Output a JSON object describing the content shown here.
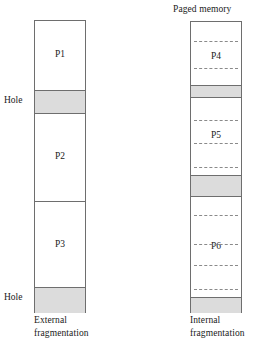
{
  "diagram": {
    "type": "diagram",
    "kind": "memory-fragmentation-comparison",
    "background_color": "#ffffff",
    "line_color": "#6e6e6e",
    "hole_fill_color": "#dcdcdc",
    "free_fill_color": "#ffffff",
    "dash_color": "#8a8a8a"
  },
  "left_column": {
    "name": "contiguous-memory",
    "caption_line1": "External",
    "caption_line2": "fragmentation",
    "title": "",
    "side_labels": [
      {
        "text": "Hole",
        "at_y": 101
      },
      {
        "text": "Hole",
        "at_y": 299
      }
    ],
    "segments": [
      {
        "id": "p1",
        "label": "P1",
        "kind": "process",
        "top": 0,
        "height": 69
      },
      {
        "id": "hole-top",
        "label": "",
        "kind": "hole",
        "top": 69,
        "height": 24
      },
      {
        "id": "p2",
        "label": "P2",
        "kind": "process",
        "top": 93,
        "height": 87
      },
      {
        "id": "p3",
        "label": "P3",
        "kind": "process",
        "top": 180,
        "height": 86
      },
      {
        "id": "hole-bot",
        "label": "",
        "kind": "hole",
        "top": 266,
        "height": 26
      }
    ]
  },
  "right_column": {
    "name": "paged-memory",
    "title": "Paged memory",
    "caption_line1": "Internal",
    "caption_line2": "fragmentation",
    "segments": [
      {
        "id": "p4",
        "label": "P4",
        "kind": "process",
        "top": 0,
        "height": 63
      },
      {
        "id": "hole-1",
        "label": "",
        "kind": "hole",
        "top": 63,
        "height": 13
      },
      {
        "id": "p5",
        "label": "P5",
        "kind": "process",
        "top": 76,
        "height": 77
      },
      {
        "id": "hole-2",
        "label": "",
        "kind": "hole",
        "top": 153,
        "height": 22
      },
      {
        "id": "p6",
        "label": "P6",
        "kind": "process",
        "top": 175,
        "height": 100
      },
      {
        "id": "hole-3",
        "label": "",
        "kind": "hole",
        "top": 275,
        "height": 16
      }
    ],
    "page_dashes": [
      19,
      46,
      98,
      121,
      145,
      193,
      222,
      243,
      267
    ]
  }
}
